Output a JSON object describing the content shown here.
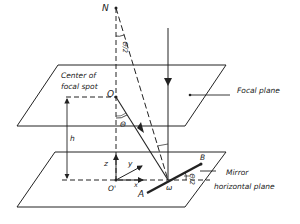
{
  "figure": {
    "type": "geometry diagram",
    "labels": {
      "N": "N",
      "theta_half_top": "Θ/2",
      "center_of_focal_spot_line1": "Center of",
      "center_of_focal_spot_line2": "focal spot",
      "O": "O",
      "theta": "Θ",
      "focal_plane": "Focal plane",
      "h": "h",
      "z": "z",
      "y": "y",
      "x": "x",
      "O_prime": "O'",
      "A": "A",
      "B": "B",
      "omega": "ω",
      "theta_half_mirror": "Θ/2",
      "mirror": "Mirror",
      "horizontal_plane": "horizontal plane"
    },
    "colors": {
      "line": "#222222",
      "background": "#ffffff"
    }
  }
}
